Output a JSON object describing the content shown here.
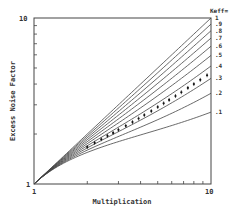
{
  "chart_data": {
    "type": "line",
    "title": "",
    "xlabel": "Multiplication",
    "ylabel": "Excess Noise Factor",
    "xscale": "log",
    "yscale": "log",
    "xlim": [
      1,
      10
    ],
    "ylim": [
      1,
      10
    ],
    "x_tick_labels": [
      "1",
      "10"
    ],
    "y_tick_labels": [
      "1",
      "10"
    ],
    "grid": false,
    "legend_title": "Keff=",
    "legend_position": "right",
    "x": [
      1,
      2,
      3,
      4,
      5,
      6,
      7,
      8,
      9,
      10
    ],
    "series": [
      {
        "name": "1",
        "k": 1.0,
        "values": [
          1,
          2,
          3,
          4,
          5,
          6,
          7,
          8,
          9,
          10
        ]
      },
      {
        "name": ".9",
        "k": 0.9,
        "values": [
          1,
          1.95,
          2.87,
          3.78,
          4.68,
          5.58,
          6.49,
          7.39,
          8.29,
          9.19
        ]
      },
      {
        "name": ".8",
        "k": 0.8,
        "values": [
          1,
          1.9,
          2.73,
          3.55,
          4.36,
          5.17,
          5.97,
          6.78,
          7.58,
          8.38
        ]
      },
      {
        "name": ".7",
        "k": 0.7,
        "values": [
          1,
          1.85,
          2.6,
          3.33,
          4.04,
          4.75,
          5.46,
          6.16,
          6.87,
          7.57
        ]
      },
      {
        "name": ".6",
        "k": 0.6,
        "values": [
          1,
          1.8,
          2.47,
          3.1,
          3.72,
          4.33,
          4.94,
          5.55,
          6.16,
          6.76
        ]
      },
      {
        "name": ".5",
        "k": 0.5,
        "values": [
          1,
          1.75,
          2.33,
          2.88,
          3.4,
          3.92,
          4.43,
          4.94,
          5.44,
          5.95
        ]
      },
      {
        "name": ".4",
        "k": 0.4,
        "values": [
          1,
          1.7,
          2.2,
          2.65,
          3.08,
          3.5,
          3.91,
          4.32,
          4.73,
          5.14
        ]
      },
      {
        "name": ".3",
        "k": 0.3,
        "values": [
          1,
          1.65,
          2.07,
          2.43,
          2.76,
          3.08,
          3.4,
          3.71,
          4.02,
          4.33
        ]
      },
      {
        "name": ".2",
        "k": 0.2,
        "values": [
          1,
          1.6,
          1.93,
          2.2,
          2.44,
          2.67,
          2.89,
          3.1,
          3.31,
          3.52
        ]
      },
      {
        "name": ".1",
        "k": 0.1,
        "values": [
          1,
          1.55,
          1.8,
          1.98,
          2.12,
          2.25,
          2.37,
          2.49,
          2.6,
          2.71
        ]
      }
    ],
    "measured": {
      "name": "measured data",
      "marker": "dot with error bars",
      "x": [
        2.0,
        2.2,
        2.4,
        2.6,
        2.8,
        3.0,
        3.3,
        3.6,
        3.9,
        4.2,
        4.6,
        5.0,
        5.4,
        5.8,
        6.3,
        6.8,
        7.4,
        8.0,
        8.7,
        9.5
      ],
      "values": [
        1.67,
        1.77,
        1.86,
        1.95,
        2.03,
        2.12,
        2.24,
        2.36,
        2.48,
        2.6,
        2.75,
        2.91,
        3.06,
        3.21,
        3.39,
        3.57,
        3.79,
        4.0,
        4.24,
        4.52
      ]
    }
  }
}
